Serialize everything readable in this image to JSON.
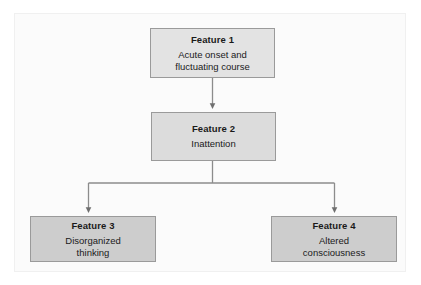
{
  "diagram": {
    "frame": {
      "background_color": "#fbfbfb",
      "border_color": "#f0f0f0"
    },
    "connector_color": "#8c8c8c",
    "nodes": [
      {
        "id": "feature-1",
        "title": "Feature 1",
        "description": "Acute onset and\nfluctuating course",
        "fill_color": "#e3e3e3",
        "border_color": "#9a9a9a"
      },
      {
        "id": "feature-2",
        "title": "Feature 2",
        "description": "Inattention",
        "fill_color": "#dcdcdc",
        "border_color": "#9a9a9a"
      },
      {
        "id": "feature-3",
        "title": "Feature 3",
        "description": "Disorganized\nthinking",
        "fill_color": "#cdcdcd",
        "border_color": "#9a9a9a"
      },
      {
        "id": "feature-4",
        "title": "Feature 4",
        "description": "Altered\nconsciousness",
        "fill_color": "#cdcdcd",
        "border_color": "#9a9a9a"
      }
    ],
    "edges": [
      {
        "id": "edge-1-to-2",
        "from": "feature-1",
        "to": "feature-2",
        "style": "straight-arrow"
      },
      {
        "id": "edge-2-to-3",
        "from": "feature-2",
        "to": "feature-3",
        "style": "elbow-arrow"
      },
      {
        "id": "edge-2-to-4",
        "from": "feature-2",
        "to": "feature-4",
        "style": "elbow-arrow"
      }
    ]
  }
}
